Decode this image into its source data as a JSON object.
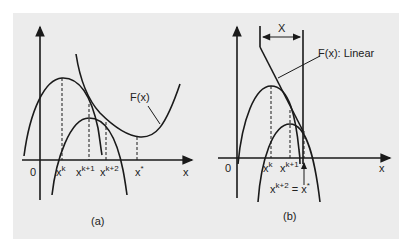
{
  "colors": {
    "background": "#ffffff",
    "panel": "#ececec",
    "ink": "#1a1a1a"
  },
  "panel_a": {
    "caption": "(a)",
    "origin_label": "0",
    "x_axis_label": "x",
    "function_label": "F(x)",
    "ticks": [
      {
        "base": "x",
        "sup": "k"
      },
      {
        "base": "x",
        "sup": "k+1"
      },
      {
        "base": "x",
        "sup": "k+2"
      },
      {
        "base": "x",
        "sup": "*"
      }
    ]
  },
  "panel_b": {
    "caption": "(b)",
    "origin_label": "0",
    "x_axis_label": "x",
    "function_label": "F(x): Linear",
    "interval_label": "X",
    "ticks": [
      {
        "base": "x",
        "sup": "k"
      },
      {
        "base": "x",
        "sup": "k+1"
      }
    ],
    "solution_label": {
      "base": "x",
      "sup": "k+2",
      "rest": " = x",
      "rest_sup": "*"
    }
  }
}
